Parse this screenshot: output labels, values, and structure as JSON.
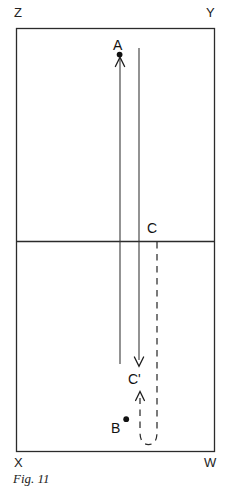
{
  "figure": {
    "caption": "Fig. 11",
    "boundary": {
      "name": "rectangle-ZYWX",
      "corners": [
        {
          "id": "Z",
          "label": "Z",
          "position": "top-left"
        },
        {
          "id": "Y",
          "label": "Y",
          "position": "top-right"
        },
        {
          "id": "W",
          "label": "W",
          "position": "bottom-right"
        },
        {
          "id": "X",
          "label": "X",
          "position": "bottom-left"
        }
      ],
      "divider": {
        "name": "midline",
        "orientation": "horizontal"
      }
    },
    "points": [
      {
        "id": "A",
        "label": "A",
        "marker": "dot"
      },
      {
        "id": "B",
        "label": "B",
        "marker": "dot"
      },
      {
        "id": "C",
        "label": "C",
        "marker": "none"
      },
      {
        "id": "C_prime",
        "label": "C'",
        "marker": "none"
      }
    ],
    "paths": [
      {
        "id": "path-up-solid",
        "style": "solid",
        "arrow": "up",
        "to": "A"
      },
      {
        "id": "path-down-solid",
        "style": "solid",
        "arrow": "down",
        "to": "C_prime"
      },
      {
        "id": "path-dashed-uturn",
        "style": "dashed",
        "arrow": "up",
        "from": "C",
        "to": "C_prime"
      }
    ]
  },
  "colors": {
    "ink": "#2b2b2b",
    "ink_dark": "#111111",
    "background": "#ffffff"
  }
}
